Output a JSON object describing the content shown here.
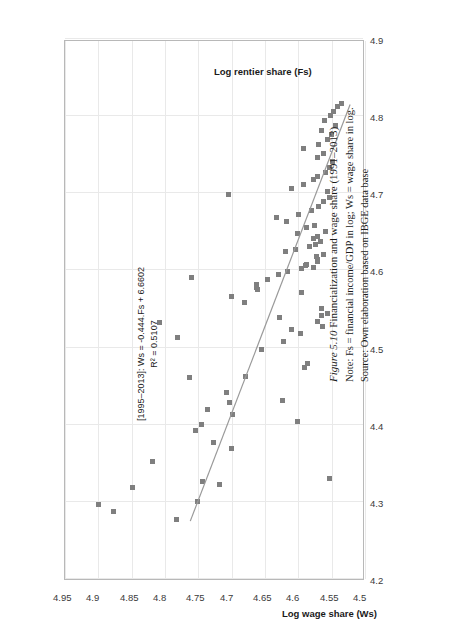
{
  "figure": {
    "label": "Figure 5.10",
    "title": "Financialization and wage share (1991–2013)",
    "note": "Note: Fs = financial income/GDP in log; Ws = wage share in log.",
    "source": "Source: Own elaboration based on IBGE data base"
  },
  "annotation": {
    "equation": "[1995–2013]: Ws = -0.444.Fs + 6.6602",
    "r_squared": "R² = 0.5107"
  },
  "colors": {
    "marker": "#7f7f7f",
    "trendline": "#9a9a9a",
    "grid": "#e9e9e9",
    "frame": "#b8b8b8"
  },
  "chart_data": {
    "type": "scatter",
    "title": "Financialization and wage share (1991–2013)",
    "xlabel": "Log rentier share (Fs)",
    "ylabel": "Log wage share (Ws)",
    "xlim": [
      4.2,
      4.9
    ],
    "ylim": [
      4.5,
      4.95
    ],
    "xticks": [
      "4.2",
      "4.3",
      "4.4",
      "4.5",
      "4.6",
      "4.7",
      "4.8",
      "4.9"
    ],
    "yticks": [
      "4.5",
      "4.55",
      "4.6",
      "4.65",
      "4.7",
      "4.75",
      "4.8",
      "4.85",
      "4.9",
      "4.95"
    ],
    "grid": true,
    "legend": "none",
    "trendline": {
      "slope": -0.444,
      "intercept": 6.6602,
      "r2": 0.5107,
      "x_start": 4.275,
      "x_end": 4.815
    },
    "points": [
      {
        "x": 4.277,
        "y": 4.783
      },
      {
        "x": 4.287,
        "y": 4.877
      },
      {
        "x": 4.296,
        "y": 4.9
      },
      {
        "x": 4.3,
        "y": 4.752
      },
      {
        "x": 4.318,
        "y": 4.849
      },
      {
        "x": 4.322,
        "y": 4.718
      },
      {
        "x": 4.327,
        "y": 4.744
      },
      {
        "x": 4.33,
        "y": 4.553
      },
      {
        "x": 4.352,
        "y": 4.819
      },
      {
        "x": 4.369,
        "y": 4.7
      },
      {
        "x": 4.377,
        "y": 4.727
      },
      {
        "x": 4.392,
        "y": 4.755
      },
      {
        "x": 4.4,
        "y": 4.746
      },
      {
        "x": 4.404,
        "y": 4.601
      },
      {
        "x": 4.413,
        "y": 4.699
      },
      {
        "x": 4.42,
        "y": 4.736
      },
      {
        "x": 4.429,
        "y": 4.703
      },
      {
        "x": 4.431,
        "y": 4.624
      },
      {
        "x": 4.442,
        "y": 4.708
      },
      {
        "x": 4.461,
        "y": 4.763
      },
      {
        "x": 4.462,
        "y": 4.679
      },
      {
        "x": 4.474,
        "y": 4.591
      },
      {
        "x": 4.479,
        "y": 4.586
      },
      {
        "x": 4.497,
        "y": 4.655
      },
      {
        "x": 4.508,
        "y": 4.622
      },
      {
        "x": 4.513,
        "y": 4.781
      },
      {
        "x": 4.518,
        "y": 4.597
      },
      {
        "x": 4.523,
        "y": 4.61
      },
      {
        "x": 4.527,
        "y": 4.564
      },
      {
        "x": 4.532,
        "y": 4.808
      },
      {
        "x": 4.534,
        "y": 4.572
      },
      {
        "x": 4.539,
        "y": 4.629
      },
      {
        "x": 4.541,
        "y": 4.566
      },
      {
        "x": 4.544,
        "y": 4.557
      },
      {
        "x": 4.551,
        "y": 4.566
      },
      {
        "x": 4.558,
        "y": 4.681
      },
      {
        "x": 4.566,
        "y": 4.7
      },
      {
        "x": 4.572,
        "y": 4.596
      },
      {
        "x": 4.575,
        "y": 4.661
      },
      {
        "x": 4.578,
        "y": 4.663
      },
      {
        "x": 4.582,
        "y": 4.663
      },
      {
        "x": 4.588,
        "y": 4.646
      },
      {
        "x": 4.591,
        "y": 4.76
      },
      {
        "x": 4.595,
        "y": 4.63
      },
      {
        "x": 4.599,
        "y": 4.617
      },
      {
        "x": 4.602,
        "y": 4.596
      },
      {
        "x": 4.604,
        "y": 4.578
      },
      {
        "x": 4.606,
        "y": 4.59
      },
      {
        "x": 4.608,
        "y": 4.588
      },
      {
        "x": 4.611,
        "y": 4.572
      },
      {
        "x": 4.614,
        "y": 4.572
      },
      {
        "x": 4.618,
        "y": 4.573
      },
      {
        "x": 4.621,
        "y": 4.563
      },
      {
        "x": 4.624,
        "y": 4.62
      },
      {
        "x": 4.627,
        "y": 4.604
      },
      {
        "x": 4.631,
        "y": 4.583
      },
      {
        "x": 4.634,
        "y": 4.575
      },
      {
        "x": 4.638,
        "y": 4.567
      },
      {
        "x": 4.641,
        "y": 4.578
      },
      {
        "x": 4.644,
        "y": 4.571
      },
      {
        "x": 4.648,
        "y": 4.601
      },
      {
        "x": 4.651,
        "y": 4.559
      },
      {
        "x": 4.655,
        "y": 4.588
      },
      {
        "x": 4.658,
        "y": 4.576
      },
      {
        "x": 4.663,
        "y": 4.618
      },
      {
        "x": 4.668,
        "y": 4.633
      },
      {
        "x": 4.672,
        "y": 4.6
      },
      {
        "x": 4.678,
        "y": 4.58
      },
      {
        "x": 4.683,
        "y": 4.57
      },
      {
        "x": 4.689,
        "y": 4.562
      },
      {
        "x": 4.694,
        "y": 4.553
      },
      {
        "x": 4.699,
        "y": 4.705
      },
      {
        "x": 4.702,
        "y": 4.556
      },
      {
        "x": 4.706,
        "y": 4.61
      },
      {
        "x": 4.712,
        "y": 4.592
      },
      {
        "x": 4.718,
        "y": 4.578
      },
      {
        "x": 4.722,
        "y": 4.571
      },
      {
        "x": 4.727,
        "y": 4.56
      },
      {
        "x": 4.734,
        "y": 4.554
      },
      {
        "x": 4.741,
        "y": 4.549
      },
      {
        "x": 4.747,
        "y": 4.572
      },
      {
        "x": 4.752,
        "y": 4.562
      },
      {
        "x": 4.758,
        "y": 4.593
      },
      {
        "x": 4.763,
        "y": 4.57
      },
      {
        "x": 4.77,
        "y": 4.557
      },
      {
        "x": 4.776,
        "y": 4.551
      },
      {
        "x": 4.781,
        "y": 4.565
      },
      {
        "x": 4.788,
        "y": 4.545
      },
      {
        "x": 4.794,
        "y": 4.561
      },
      {
        "x": 4.801,
        "y": 4.552
      },
      {
        "x": 4.806,
        "y": 4.548
      },
      {
        "x": 4.812,
        "y": 4.541
      },
      {
        "x": 4.816,
        "y": 4.536
      }
    ]
  }
}
